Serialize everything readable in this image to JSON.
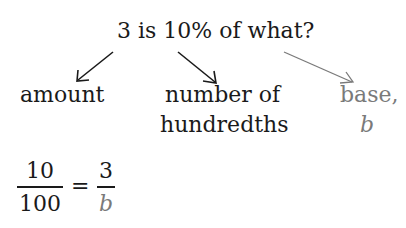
{
  "question": "3 is 10% of what?",
  "labels": {
    "amount": "amount",
    "hundredths_line1": "number of",
    "hundredths_line2": "hundredths",
    "base_line1": "base,",
    "base_line2": "b"
  },
  "equation": {
    "left_numerator": "10",
    "left_denominator": "100",
    "equals": "=",
    "right_numerator": "3",
    "right_denominator": "b"
  },
  "colors": {
    "text": "#1a1a1a",
    "base_highlight": "#7a7a7a"
  }
}
